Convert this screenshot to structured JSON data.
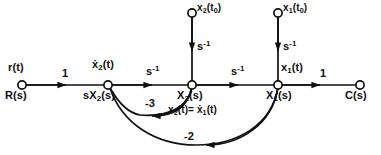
{
  "diagram": {
    "stroke_color": "#101010",
    "background": "#ffffff",
    "nodes": [
      {
        "id": "input",
        "x": 22,
        "y": 85,
        "upper_label": "r(t)",
        "lower_label": "R(s)"
      },
      {
        "id": "n2dot",
        "x": 108,
        "y": 85,
        "upper_label": "ẋ₂(t)",
        "lower_label": "sX₂(s)"
      },
      {
        "id": "n2",
        "x": 192,
        "y": 85,
        "upper_label": "",
        "lower_label": "X₂(s)"
      },
      {
        "id": "n1",
        "x": 278,
        "y": 85,
        "upper_label": "x₁(t)",
        "lower_label": "X₁(s)"
      },
      {
        "id": "output",
        "x": 360,
        "y": 85,
        "upper_label": "",
        "lower_label": "C(s)"
      }
    ],
    "source_nodes": [
      {
        "id": "ic2",
        "x": 192,
        "y": 13,
        "label": "x₂(t₀)"
      },
      {
        "id": "ic1",
        "x": 278,
        "y": 13,
        "label": "x₁(t₀)"
      }
    ],
    "branch_gains": {
      "input_to_x2dot": "1",
      "x2dot_to_x2": "s⁻¹",
      "x2_to_x1": "s⁻¹",
      "x1_to_output": "1",
      "ic2_to_x2": "s⁻¹",
      "ic1_to_x1": "s⁻¹",
      "x2_to_x2dot_feedback": "-3",
      "x1_to_x2dot_feedback": "-2"
    },
    "annotations": {
      "x2_identity": "x₂(t)= ẋ₁(t)"
    },
    "labels_plain": {
      "r_t": "r(t)",
      "R_s": "R(s)",
      "x2dot_t": "ẋ₂(t)",
      "sX2_s": "sX₂(s)",
      "X2_s": "X₂(s)",
      "x1_t": "x₁(t)",
      "X1_s": "X₁(s)",
      "C_s": "C(s)",
      "x2_t0": "x₂(t₀)",
      "x1_t0": "x₁(t₀)",
      "gain_one_left": "1",
      "gain_one_right": "1",
      "s_inv_a": "s⁻¹",
      "s_inv_b": "s⁻¹",
      "s_inv_c": "s⁻¹",
      "s_inv_d": "s⁻¹",
      "fb_minus_three": "-3",
      "fb_minus_two": "-2"
    }
  }
}
